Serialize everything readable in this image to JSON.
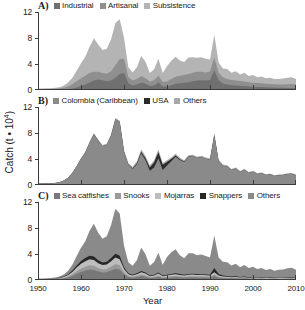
{
  "axes": {
    "xlabel": "Year",
    "ylabel_prefix": "Catch (t ",
    "ylabel_mult": "• 10",
    "ylabel_exp": "4",
    "ylabel_suffix": ")",
    "xticks": [
      1950,
      1960,
      1970,
      1980,
      1990,
      2000,
      2010
    ],
    "yticks": [
      0,
      4,
      8,
      12
    ],
    "xlim": [
      1950,
      2010
    ],
    "ylim": [
      0,
      12
    ]
  },
  "panels": [
    {
      "letter": "A)",
      "legend": [
        {
          "label": "Industrial",
          "color": "#707070"
        },
        {
          "label": "Artisanal",
          "color": "#8f8f8f"
        },
        {
          "label": "Subsistence",
          "color": "#b4b4b4"
        }
      ]
    },
    {
      "letter": "B)",
      "legend": [
        {
          "label": "Colombia (Caribbean)",
          "color": "#8a8a8a"
        },
        {
          "label": "USA",
          "color": "#2b2b2b"
        },
        {
          "label": "Others",
          "color": "#a8a8a8"
        }
      ]
    },
    {
      "letter": "C)",
      "legend": [
        {
          "label": "Sea catfishes",
          "color": "#787878"
        },
        {
          "label": "Snooks",
          "color": "#9a9a9a"
        },
        {
          "label": "Mojarras",
          "color": "#bdbdbd"
        },
        {
          "label": "Snappers",
          "color": "#262626"
        },
        {
          "label": "Others",
          "color": "#8a8a8a"
        }
      ]
    }
  ],
  "chart_data": [
    {
      "type": "area",
      "title": "A) Catch by sector",
      "stacked": true,
      "xlabel": "Year",
      "ylabel": "Catch (t * 10^4)",
      "xlim": [
        1950,
        2010
      ],
      "ylim": [
        0,
        12
      ],
      "grid": false,
      "legend_position": "top",
      "x": [
        1950,
        1951,
        1952,
        1953,
        1954,
        1955,
        1956,
        1957,
        1958,
        1959,
        1960,
        1961,
        1962,
        1963,
        1964,
        1965,
        1966,
        1967,
        1968,
        1969,
        1970,
        1971,
        1972,
        1973,
        1974,
        1975,
        1976,
        1977,
        1978,
        1979,
        1980,
        1981,
        1982,
        1983,
        1984,
        1985,
        1986,
        1987,
        1988,
        1989,
        1990,
        1991,
        1992,
        1993,
        1994,
        1995,
        1996,
        1997,
        1998,
        1999,
        2000,
        2001,
        2002,
        2003,
        2004,
        2005,
        2006,
        2007,
        2008,
        2009,
        2010
      ],
      "series": [
        {
          "name": "Industrial",
          "values": [
            0.05,
            0.05,
            0.06,
            0.06,
            0.07,
            0.08,
            0.1,
            0.15,
            0.25,
            0.4,
            0.6,
            0.85,
            1.15,
            1.45,
            1.6,
            1.5,
            1.35,
            1.45,
            1.9,
            2.45,
            2.6,
            1.05,
            0.7,
            0.85,
            1.1,
            0.95,
            0.6,
            0.7,
            1.15,
            0.55,
            0.55,
            0.75,
            0.95,
            1.05,
            1.1,
            1.2,
            1.35,
            1.45,
            1.5,
            1.45,
            1.55,
            3.05,
            1.5,
            1.0,
            0.85,
            0.75,
            0.7,
            0.65,
            0.6,
            0.55,
            0.5,
            0.48,
            0.45,
            0.42,
            0.4,
            0.38,
            0.36,
            0.34,
            0.32,
            0.3,
            0.28
          ]
        },
        {
          "name": "Artisanal",
          "values": [
            0.08,
            0.08,
            0.09,
            0.1,
            0.12,
            0.16,
            0.25,
            0.4,
            0.65,
            0.95,
            1.2,
            1.35,
            1.45,
            1.35,
            1.2,
            1.1,
            1.15,
            1.45,
            1.9,
            2.3,
            2.2,
            0.95,
            0.75,
            0.85,
            1.0,
            0.9,
            0.7,
            0.8,
            1.05,
            0.7,
            0.75,
            0.95,
            1.1,
            1.15,
            1.2,
            1.25,
            1.3,
            1.35,
            1.3,
            1.25,
            1.3,
            1.95,
            1.15,
            0.95,
            0.85,
            0.8,
            0.75,
            0.72,
            0.7,
            0.66,
            0.62,
            0.6,
            0.58,
            0.55,
            0.52,
            0.5,
            0.5,
            0.52,
            0.58,
            0.62,
            0.55
          ]
        },
        {
          "name": "Subsistence",
          "values": [
            0.1,
            0.1,
            0.11,
            0.12,
            0.14,
            0.2,
            0.35,
            0.6,
            1.0,
            1.6,
            2.3,
            2.9,
            4.05,
            5.15,
            4.2,
            3.55,
            3.85,
            4.9,
            6.5,
            6.15,
            3.25,
            1.55,
            1.25,
            1.8,
            3.15,
            2.5,
            1.3,
            1.7,
            2.6,
            1.35,
            2.35,
            2.8,
            3.05,
            2.35,
            2.0,
            2.55,
            2.4,
            2.15,
            2.25,
            2.1,
            1.85,
            3.5,
            1.6,
            1.35,
            1.55,
            1.1,
            1.45,
            1.0,
            1.35,
            0.95,
            1.2,
            0.9,
            1.05,
            0.85,
            0.95,
            0.8,
            0.85,
            0.9,
            1.0,
            1.05,
            0.85
          ]
        }
      ]
    },
    {
      "type": "area",
      "title": "B) Catch by fishing country",
      "stacked": true,
      "xlabel": "Year",
      "ylabel": "Catch (t * 10^4)",
      "xlim": [
        1950,
        2010
      ],
      "ylim": [
        0,
        12
      ],
      "grid": false,
      "legend_position": "top",
      "x": [
        1950,
        1951,
        1952,
        1953,
        1954,
        1955,
        1956,
        1957,
        1958,
        1959,
        1960,
        1961,
        1962,
        1963,
        1964,
        1965,
        1966,
        1967,
        1968,
        1969,
        1970,
        1971,
        1972,
        1973,
        1974,
        1975,
        1976,
        1977,
        1978,
        1979,
        1980,
        1981,
        1982,
        1983,
        1984,
        1985,
        1986,
        1987,
        1988,
        1989,
        1990,
        1991,
        1992,
        1993,
        1994,
        1995,
        1996,
        1997,
        1998,
        1999,
        2000,
        2001,
        2002,
        2003,
        2004,
        2005,
        2006,
        2007,
        2008,
        2009,
        2010
      ],
      "series": [
        {
          "name": "Colombia (Caribbean)",
          "values": [
            0.22,
            0.22,
            0.25,
            0.27,
            0.32,
            0.43,
            0.68,
            1.12,
            1.85,
            2.9,
            4.05,
            5.0,
            6.5,
            7.8,
            6.8,
            5.95,
            6.2,
            7.6,
            10.1,
            9.7,
            5.15,
            3.1,
            2.45,
            3.2,
            4.9,
            3.8,
            2.2,
            2.7,
            4.1,
            2.3,
            3.0,
            3.65,
            4.35,
            3.85,
            3.55,
            4.35,
            4.45,
            4.15,
            4.3,
            4.05,
            3.9,
            7.7,
            3.7,
            2.95,
            2.85,
            2.3,
            2.55,
            2.0,
            2.35,
            1.85,
            2.05,
            1.7,
            1.8,
            1.55,
            1.65,
            1.4,
            1.5,
            1.55,
            1.7,
            1.75,
            1.5
          ]
        },
        {
          "name": "USA",
          "values": [
            0.0,
            0.0,
            0.0,
            0.0,
            0.0,
            0.0,
            0.0,
            0.0,
            0.0,
            0.0,
            0.0,
            0.0,
            0.0,
            0.0,
            0.0,
            0.0,
            0.0,
            0.0,
            0.0,
            0.0,
            0.0,
            0.05,
            0.1,
            0.15,
            0.2,
            0.3,
            0.5,
            0.75,
            0.95,
            0.8,
            0.55,
            0.35,
            0.2,
            0.1,
            0.05,
            0.02,
            0.0,
            0.0,
            0.0,
            0.0,
            0.0,
            0.0,
            0.0,
            0.0,
            0.0,
            0.0,
            0.0,
            0.0,
            0.0,
            0.0,
            0.0,
            0.0,
            0.0,
            0.0,
            0.0,
            0.0,
            0.0,
            0.0,
            0.0,
            0.0,
            0.0
          ]
        },
        {
          "name": "Others",
          "values": [
            0.01,
            0.01,
            0.01,
            0.01,
            0.01,
            0.01,
            0.02,
            0.03,
            0.05,
            0.05,
            0.05,
            0.1,
            0.15,
            0.15,
            0.2,
            0.2,
            0.15,
            0.2,
            0.2,
            0.2,
            0.25,
            0.25,
            0.25,
            0.3,
            0.35,
            0.35,
            0.3,
            0.35,
            0.4,
            0.3,
            0.25,
            0.25,
            0.25,
            0.25,
            0.2,
            0.2,
            0.2,
            0.2,
            0.2,
            0.2,
            0.2,
            0.3,
            0.2,
            0.2,
            0.2,
            0.15,
            0.15,
            0.15,
            0.15,
            0.15,
            0.15,
            0.12,
            0.12,
            0.1,
            0.1,
            0.1,
            0.1,
            0.1,
            0.1,
            0.1,
            0.1
          ]
        }
      ]
    },
    {
      "type": "area",
      "title": "C) Catch by taxon",
      "stacked": true,
      "xlabel": "Year",
      "ylabel": "Catch (t * 10^4)",
      "xlim": [
        1950,
        2010
      ],
      "ylim": [
        0,
        12
      ],
      "grid": false,
      "legend_position": "top",
      "x": [
        1950,
        1951,
        1952,
        1953,
        1954,
        1955,
        1956,
        1957,
        1958,
        1959,
        1960,
        1961,
        1962,
        1963,
        1964,
        1965,
        1966,
        1967,
        1968,
        1969,
        1970,
        1971,
        1972,
        1973,
        1974,
        1975,
        1976,
        1977,
        1978,
        1979,
        1980,
        1981,
        1982,
        1983,
        1984,
        1985,
        1986,
        1987,
        1988,
        1989,
        1990,
        1991,
        1992,
        1993,
        1994,
        1995,
        1996,
        1997,
        1998,
        1999,
        2000,
        2001,
        2002,
        2003,
        2004,
        2005,
        2006,
        2007,
        2008,
        2009,
        2010
      ],
      "series": [
        {
          "name": "Sea catfishes",
          "values": [
            0.05,
            0.05,
            0.06,
            0.07,
            0.09,
            0.14,
            0.22,
            0.38,
            0.62,
            0.95,
            1.25,
            1.45,
            1.6,
            1.55,
            1.3,
            1.15,
            1.2,
            1.45,
            1.75,
            1.6,
            0.85,
            0.45,
            0.35,
            0.45,
            0.6,
            0.5,
            0.3,
            0.35,
            0.5,
            0.3,
            0.35,
            0.4,
            0.45,
            0.4,
            0.35,
            0.4,
            0.42,
            0.4,
            0.4,
            0.38,
            0.35,
            0.6,
            0.35,
            0.28,
            0.26,
            0.22,
            0.24,
            0.2,
            0.22,
            0.18,
            0.2,
            0.17,
            0.18,
            0.15,
            0.16,
            0.14,
            0.15,
            0.15,
            0.17,
            0.18,
            0.15
          ]
        },
        {
          "name": "Snooks",
          "values": [
            0.02,
            0.02,
            0.02,
            0.03,
            0.04,
            0.06,
            0.1,
            0.16,
            0.26,
            0.4,
            0.52,
            0.6,
            0.66,
            0.64,
            0.54,
            0.48,
            0.5,
            0.6,
            0.72,
            0.66,
            0.35,
            0.18,
            0.14,
            0.18,
            0.25,
            0.2,
            0.12,
            0.14,
            0.2,
            0.12,
            0.14,
            0.16,
            0.18,
            0.16,
            0.14,
            0.16,
            0.17,
            0.16,
            0.16,
            0.15,
            0.14,
            0.25,
            0.14,
            0.11,
            0.1,
            0.09,
            0.1,
            0.08,
            0.09,
            0.07,
            0.08,
            0.07,
            0.07,
            0.06,
            0.06,
            0.06,
            0.06,
            0.06,
            0.07,
            0.07,
            0.06
          ]
        },
        {
          "name": "Mojarras",
          "values": [
            0.02,
            0.02,
            0.03,
            0.03,
            0.05,
            0.08,
            0.13,
            0.22,
            0.36,
            0.56,
            0.72,
            0.84,
            0.92,
            0.89,
            0.75,
            0.66,
            0.69,
            0.83,
            1.0,
            0.92,
            0.49,
            0.25,
            0.2,
            0.26,
            0.35,
            0.29,
            0.17,
            0.2,
            0.29,
            0.17,
            0.2,
            0.23,
            0.25,
            0.22,
            0.2,
            0.23,
            0.24,
            0.22,
            0.23,
            0.21,
            0.2,
            0.35,
            0.2,
            0.16,
            0.15,
            0.12,
            0.14,
            0.11,
            0.13,
            0.1,
            0.11,
            0.09,
            0.1,
            0.08,
            0.09,
            0.08,
            0.08,
            0.08,
            0.09,
            0.1,
            0.08
          ]
        },
        {
          "name": "Snappers",
          "values": [
            0.02,
            0.02,
            0.02,
            0.02,
            0.03,
            0.05,
            0.08,
            0.13,
            0.21,
            0.33,
            0.42,
            0.49,
            0.54,
            0.52,
            0.44,
            0.39,
            0.4,
            0.49,
            0.58,
            0.54,
            0.28,
            0.15,
            0.12,
            0.15,
            0.2,
            0.17,
            0.1,
            0.12,
            0.17,
            0.1,
            0.11,
            0.13,
            0.15,
            0.13,
            0.12,
            0.13,
            0.14,
            0.13,
            0.13,
            0.12,
            0.12,
            0.65,
            0.22,
            0.14,
            0.12,
            0.1,
            0.11,
            0.09,
            0.1,
            0.08,
            0.09,
            0.07,
            0.08,
            0.06,
            0.07,
            0.06,
            0.07,
            0.07,
            0.08,
            0.08,
            0.07
          ]
        },
        {
          "name": "Others",
          "values": [
            0.12,
            0.12,
            0.13,
            0.14,
            0.16,
            0.2,
            0.32,
            0.55,
            0.9,
            1.45,
            2.05,
            2.6,
            3.85,
            5.05,
            4.25,
            3.65,
            3.95,
            5.1,
            6.9,
            6.5,
            3.35,
            1.7,
            1.4,
            2.0,
            3.6,
            2.8,
            1.5,
            1.95,
            3.05,
            1.65,
            2.75,
            3.35,
            3.7,
            2.9,
            2.55,
            3.2,
            3.15,
            2.9,
            3.0,
            2.85,
            2.65,
            5.0,
            2.55,
            2.1,
            2.1,
            1.7,
            1.9,
            1.5,
            1.75,
            1.4,
            1.55,
            1.3,
            1.4,
            1.2,
            1.3,
            1.1,
            1.2,
            1.25,
            1.4,
            1.45,
            1.2
          ]
        }
      ]
    }
  ]
}
